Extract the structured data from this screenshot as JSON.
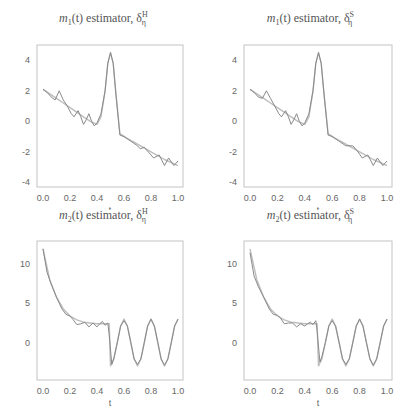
{
  "chart_data": [
    {
      "type": "line",
      "title": "m1(t) estimator, δη^H",
      "title_parts": {
        "func": "m",
        "sub": "1",
        "arg": "(t)",
        "word": " estimator, δ",
        "sup": "H",
        "subsym": "η"
      },
      "xlabel": "t",
      "ylabel": "",
      "xlim": [
        0,
        1
      ],
      "ylim": [
        -4.3,
        5.0
      ],
      "xticks": [
        "0.0",
        "0.2",
        "0.4",
        "0.6",
        "0.8",
        "1.0"
      ],
      "yticks": [
        "4",
        "2",
        "0",
        "-2",
        "-4"
      ],
      "ytick_values": [
        4,
        2,
        0,
        -2,
        -4
      ],
      "grid": false,
      "series": [
        {
          "name": "true",
          "color": "#bdbdbd",
          "x": [
            0,
            0.05,
            0.1,
            0.15,
            0.2,
            0.25,
            0.3,
            0.35,
            0.4,
            0.43,
            0.46,
            0.48,
            0.5,
            0.52,
            0.54,
            0.57,
            0.62,
            0.7,
            0.8,
            0.9,
            1.0
          ],
          "y": [
            2.1,
            1.8,
            1.5,
            1.2,
            0.9,
            0.6,
            0.3,
            0.0,
            -0.2,
            0.3,
            2.0,
            3.8,
            4.5,
            3.8,
            1.8,
            -0.8,
            -1.1,
            -1.5,
            -2.0,
            -2.5,
            -2.9
          ]
        },
        {
          "name": "estimate",
          "color": "#8a8a8a",
          "x": [
            0,
            0.03,
            0.06,
            0.09,
            0.12,
            0.15,
            0.18,
            0.21,
            0.23,
            0.26,
            0.28,
            0.3,
            0.32,
            0.34,
            0.36,
            0.38,
            0.4,
            0.43,
            0.46,
            0.48,
            0.5,
            0.52,
            0.54,
            0.57,
            0.6,
            0.65,
            0.7,
            0.72,
            0.75,
            0.78,
            0.82,
            0.86,
            0.9,
            0.93,
            0.97,
            1.0
          ],
          "y": [
            2.1,
            1.9,
            1.6,
            1.4,
            2.0,
            1.4,
            1.0,
            0.5,
            0.3,
            0.7,
            0.3,
            -0.2,
            0.1,
            0.5,
            0.0,
            -0.3,
            -0.1,
            0.5,
            2.0,
            3.8,
            4.5,
            3.8,
            1.8,
            -0.9,
            -1.0,
            -1.3,
            -1.6,
            -1.8,
            -1.7,
            -2.0,
            -2.4,
            -2.2,
            -2.9,
            -2.4,
            -2.9,
            -2.6
          ]
        }
      ]
    },
    {
      "type": "line",
      "title": "m1(t) estimator, δη^S",
      "title_parts": {
        "func": "m",
        "sub": "1",
        "arg": "(t)",
        "word": " estimator, δ",
        "sup": "S",
        "subsym": "η"
      },
      "xlabel": "t",
      "ylabel": "",
      "xlim": [
        0,
        1
      ],
      "ylim": [
        -4.3,
        5.0
      ],
      "xticks": [
        "0.0",
        "0.2",
        "0.4",
        "0.6",
        "0.8",
        "1.0"
      ],
      "yticks": [
        "4",
        "2",
        "0",
        "-2",
        "-4"
      ],
      "ytick_values": [
        4,
        2,
        0,
        -2,
        -4
      ],
      "grid": false,
      "series": [
        {
          "name": "true",
          "color": "#bdbdbd",
          "x": [
            0,
            0.05,
            0.1,
            0.15,
            0.2,
            0.25,
            0.3,
            0.35,
            0.4,
            0.43,
            0.46,
            0.48,
            0.5,
            0.52,
            0.54,
            0.57,
            0.62,
            0.7,
            0.8,
            0.9,
            1.0
          ],
          "y": [
            2.1,
            1.8,
            1.5,
            1.2,
            0.9,
            0.6,
            0.3,
            0.0,
            -0.2,
            0.3,
            2.0,
            3.8,
            4.5,
            3.8,
            1.8,
            -0.8,
            -1.1,
            -1.5,
            -2.0,
            -2.5,
            -2.9
          ]
        },
        {
          "name": "estimate",
          "color": "#8a8a8a",
          "x": [
            0,
            0.03,
            0.06,
            0.09,
            0.12,
            0.15,
            0.18,
            0.21,
            0.23,
            0.26,
            0.28,
            0.3,
            0.32,
            0.34,
            0.36,
            0.38,
            0.4,
            0.43,
            0.46,
            0.48,
            0.5,
            0.52,
            0.54,
            0.57,
            0.6,
            0.65,
            0.7,
            0.75,
            0.78,
            0.82,
            0.86,
            0.9,
            0.93,
            0.97,
            1.0
          ],
          "y": [
            2.1,
            1.9,
            1.6,
            1.5,
            2.0,
            1.5,
            1.0,
            0.5,
            0.3,
            0.7,
            0.3,
            -0.2,
            0.1,
            0.5,
            0.0,
            -0.3,
            -0.1,
            0.5,
            2.0,
            3.8,
            4.5,
            3.8,
            1.8,
            -0.9,
            -1.0,
            -1.3,
            -1.6,
            -1.6,
            -1.9,
            -2.4,
            -2.2,
            -2.9,
            -2.4,
            -2.9,
            -2.6
          ]
        }
      ]
    },
    {
      "type": "line",
      "title": "m2(t) estimator, δη^H",
      "title_parts": {
        "func": "m",
        "sub": "2",
        "arg": "(t)",
        "word": " estimator, δ",
        "sup": "H",
        "subsym": "η"
      },
      "xlabel": "t",
      "ylabel": "",
      "xlim": [
        0,
        1
      ],
      "ylim": [
        -4.8,
        13.0
      ],
      "xticks": [
        "0.0",
        "0.2",
        "0.4",
        "0.6",
        "0.8",
        "1.0"
      ],
      "yticks": [
        "10",
        "5",
        "0"
      ],
      "ytick_values": [
        10,
        5,
        0
      ],
      "grid": false,
      "series": [
        {
          "name": "true",
          "color": "#bdbdbd",
          "x": [
            0,
            0.05,
            0.1,
            0.15,
            0.2,
            0.25,
            0.3,
            0.35,
            0.4,
            0.45,
            0.49,
            0.5,
            0.525,
            0.55,
            0.575,
            0.6,
            0.625,
            0.65,
            0.675,
            0.7,
            0.725,
            0.75,
            0.775,
            0.8,
            0.825,
            0.85,
            0.875,
            0.9,
            0.925,
            0.95,
            0.975,
            1.0
          ],
          "y": [
            12,
            8,
            5.8,
            4.3,
            3.4,
            2.9,
            2.6,
            2.5,
            2.4,
            2.4,
            2.4,
            -3.0,
            -2.1,
            0,
            2.1,
            3.0,
            2.1,
            0,
            -2.1,
            -3.0,
            -2.1,
            0,
            2.1,
            3.0,
            2.1,
            0,
            -2.1,
            -3.0,
            -2.1,
            0,
            2.1,
            3.0
          ]
        },
        {
          "name": "estimate",
          "color": "#8a8a8a",
          "x": [
            0,
            0.03,
            0.06,
            0.1,
            0.14,
            0.17,
            0.2,
            0.22,
            0.25,
            0.28,
            0.31,
            0.34,
            0.37,
            0.4,
            0.42,
            0.44,
            0.46,
            0.48,
            0.49,
            0.51,
            0.525,
            0.55,
            0.575,
            0.6,
            0.625,
            0.65,
            0.675,
            0.7,
            0.725,
            0.75,
            0.775,
            0.8,
            0.825,
            0.85,
            0.875,
            0.9,
            0.925,
            0.95,
            0.975,
            1.0
          ],
          "y": [
            12,
            9,
            7.5,
            5.8,
            4.3,
            3.6,
            3.4,
            3.0,
            2.3,
            2.4,
            2.6,
            2.0,
            2.5,
            2.0,
            2.4,
            2.7,
            2.2,
            2.5,
            1.0,
            -2.8,
            -2.0,
            0,
            2.1,
            2.8,
            2.1,
            0,
            -2.1,
            -2.8,
            -2.1,
            0,
            2.1,
            3.0,
            2.1,
            0,
            -2.1,
            -2.9,
            -2.1,
            0,
            2.1,
            3.0
          ]
        }
      ]
    },
    {
      "type": "line",
      "title": "m2(t) estimator, δη^S",
      "title_parts": {
        "func": "m",
        "sub": "2",
        "arg": "(t)",
        "word": " estimator, δ",
        "sup": "S",
        "subsym": "η"
      },
      "xlabel": "t",
      "ylabel": "",
      "xlim": [
        0,
        1
      ],
      "ylim": [
        -4.8,
        13.0
      ],
      "xticks": [
        "0.0",
        "0.2",
        "0.4",
        "0.6",
        "0.8",
        "1.0"
      ],
      "yticks": [
        "10",
        "5",
        "0"
      ],
      "ytick_values": [
        10,
        5,
        0
      ],
      "grid": false,
      "series": [
        {
          "name": "true",
          "color": "#bdbdbd",
          "x": [
            0,
            0.05,
            0.1,
            0.15,
            0.2,
            0.25,
            0.3,
            0.35,
            0.4,
            0.45,
            0.49,
            0.5,
            0.525,
            0.55,
            0.575,
            0.6,
            0.625,
            0.65,
            0.675,
            0.7,
            0.725,
            0.75,
            0.775,
            0.8,
            0.825,
            0.85,
            0.875,
            0.9,
            0.925,
            0.95,
            0.975,
            1.0
          ],
          "y": [
            12,
            8,
            5.8,
            4.3,
            3.4,
            2.9,
            2.6,
            2.5,
            2.4,
            2.4,
            2.4,
            -3.0,
            -2.1,
            0,
            2.1,
            3.0,
            2.1,
            0,
            -2.1,
            -3.0,
            -2.1,
            0,
            2.1,
            3.0,
            2.1,
            0,
            -2.1,
            -3.0,
            -2.1,
            0,
            2.1,
            3.0
          ]
        },
        {
          "name": "estimate",
          "color": "#8a8a8a",
          "x": [
            0,
            0.03,
            0.06,
            0.1,
            0.14,
            0.17,
            0.2,
            0.22,
            0.25,
            0.28,
            0.31,
            0.34,
            0.37,
            0.4,
            0.42,
            0.44,
            0.46,
            0.48,
            0.49,
            0.51,
            0.525,
            0.55,
            0.575,
            0.6,
            0.625,
            0.65,
            0.675,
            0.7,
            0.725,
            0.75,
            0.775,
            0.8,
            0.825,
            0.85,
            0.875,
            0.9,
            0.925,
            0.95,
            0.975,
            1.0
          ],
          "y": [
            11.5,
            8.5,
            7.2,
            5.8,
            4.3,
            3.6,
            3.5,
            3.2,
            2.4,
            2.5,
            2.5,
            2.0,
            2.4,
            2.1,
            2.4,
            2.6,
            2.3,
            2.8,
            1.5,
            -2.5,
            -1.8,
            0,
            2.1,
            2.8,
            2.1,
            0,
            -2.1,
            -2.8,
            -2.1,
            0,
            2.1,
            3.0,
            2.1,
            0,
            -2.1,
            -2.9,
            -2.1,
            0,
            2.1,
            3.0
          ]
        }
      ]
    }
  ],
  "layout": {
    "frame_color": "#c4c4c4",
    "panels": [
      {
        "left": 0,
        "top": 0,
        "plot": {
          "x0": 37,
          "x1": 183,
          "y0": 45,
          "y1": 187
        }
      },
      {
        "left": 207,
        "top": 0,
        "plot": {
          "x0": 37,
          "x1": 185,
          "y0": 45,
          "y1": 187
        }
      },
      {
        "left": 0,
        "top": 210,
        "plot": {
          "x0": 37,
          "x1": 183,
          "y0": 31,
          "y1": 170
        }
      },
      {
        "left": 207,
        "top": 210,
        "plot": {
          "x0": 37,
          "x1": 185,
          "y0": 31,
          "y1": 170
        }
      }
    ]
  }
}
